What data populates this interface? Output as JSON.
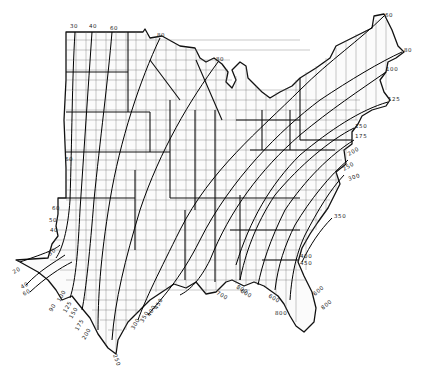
{
  "map": {
    "description": "Contour isoline map over the central and eastern United States with county boundaries",
    "background_color": "#ffffff",
    "line_color": "#000000",
    "contour_labels": [
      {
        "id": "n30",
        "text": "30",
        "x": 70,
        "y": 28,
        "rotate": 0
      },
      {
        "id": "n40",
        "text": "40",
        "x": 89,
        "y": 28,
        "rotate": 0
      },
      {
        "id": "n60",
        "text": "60",
        "x": 110,
        "y": 30,
        "rotate": 0
      },
      {
        "id": "n80a",
        "text": "80",
        "x": 157,
        "y": 37,
        "rotate": 0
      },
      {
        "id": "n80b",
        "text": "80",
        "x": 216,
        "y": 61,
        "rotate": 0
      },
      {
        "id": "ne60",
        "text": "60",
        "x": 385,
        "y": 17,
        "rotate": -15
      },
      {
        "id": "ne80",
        "text": "80",
        "x": 404,
        "y": 52,
        "rotate": 0
      },
      {
        "id": "e100",
        "text": "100",
        "x": 386,
        "y": 71,
        "rotate": 0
      },
      {
        "id": "e125",
        "text": "125",
        "x": 388,
        "y": 101,
        "rotate": 0
      },
      {
        "id": "e150",
        "text": "150",
        "x": 355,
        "y": 128,
        "rotate": 0
      },
      {
        "id": "e175",
        "text": "175",
        "x": 355,
        "y": 138,
        "rotate": 0
      },
      {
        "id": "e200",
        "text": "200",
        "x": 349,
        "y": 156,
        "rotate": -30
      },
      {
        "id": "e250",
        "text": "250",
        "x": 344,
        "y": 171,
        "rotate": -30
      },
      {
        "id": "e300",
        "text": "300",
        "x": 349,
        "y": 181,
        "rotate": -20
      },
      {
        "id": "e350",
        "text": "350",
        "x": 334,
        "y": 218,
        "rotate": 0
      },
      {
        "id": "se400",
        "text": "400",
        "x": 300,
        "y": 258,
        "rotate": 0
      },
      {
        "id": "se450",
        "text": "450",
        "x": 300,
        "y": 265,
        "rotate": 0
      },
      {
        "id": "fl600a",
        "text": "600",
        "x": 240,
        "y": 292,
        "rotate": 30
      },
      {
        "id": "fl600b",
        "text": "600",
        "x": 268,
        "y": 297,
        "rotate": 30
      },
      {
        "id": "fl600c",
        "text": "600",
        "x": 315,
        "y": 296,
        "rotate": -40
      },
      {
        "id": "fl800a",
        "text": "800",
        "x": 275,
        "y": 315,
        "rotate": 0
      },
      {
        "id": "fl800b",
        "text": "800",
        "x": 323,
        "y": 310,
        "rotate": -40
      },
      {
        "id": "g700",
        "text": "700",
        "x": 216,
        "y": 294,
        "rotate": 30
      },
      {
        "id": "g800",
        "text": "800",
        "x": 236,
        "y": 288,
        "rotate": 30
      },
      {
        "id": "w60a",
        "text": "60",
        "x": 65,
        "y": 161,
        "rotate": 0
      },
      {
        "id": "w60b",
        "text": "60",
        "x": 52,
        "y": 210,
        "rotate": 0
      },
      {
        "id": "w50",
        "text": "50",
        "x": 49,
        "y": 222,
        "rotate": 0
      },
      {
        "id": "w40",
        "text": "40",
        "x": 50,
        "y": 232,
        "rotate": 0
      },
      {
        "id": "w30",
        "text": "30",
        "x": 50,
        "y": 256,
        "rotate": -40
      },
      {
        "id": "w20",
        "text": "20",
        "x": 14,
        "y": 274,
        "rotate": -30
      },
      {
        "id": "w40b",
        "text": "40",
        "x": 22,
        "y": 289,
        "rotate": -30
      },
      {
        "id": "w60c",
        "text": "60",
        "x": 24,
        "y": 296,
        "rotate": -30
      },
      {
        "id": "t90",
        "text": "90",
        "x": 52,
        "y": 312,
        "rotate": -60
      },
      {
        "id": "t100",
        "text": "100",
        "x": 60,
        "y": 302,
        "rotate": -60
      },
      {
        "id": "t125",
        "text": "125",
        "x": 66,
        "y": 313,
        "rotate": -60
      },
      {
        "id": "t150",
        "text": "150",
        "x": 72,
        "y": 319,
        "rotate": -60
      },
      {
        "id": "t175",
        "text": "175",
        "x": 78,
        "y": 331,
        "rotate": -60
      },
      {
        "id": "t200",
        "text": "200",
        "x": 85,
        "y": 340,
        "rotate": -60
      },
      {
        "id": "t250",
        "text": "250",
        "x": 113,
        "y": 355,
        "rotate": 70
      },
      {
        "id": "g300",
        "text": "300",
        "x": 134,
        "y": 330,
        "rotate": -60
      },
      {
        "id": "g350",
        "text": "350",
        "x": 143,
        "y": 323,
        "rotate": -60
      },
      {
        "id": "g400",
        "text": "400",
        "x": 150,
        "y": 317,
        "rotate": -60
      },
      {
        "id": "g450",
        "text": "450",
        "x": 157,
        "y": 310,
        "rotate": -60
      }
    ]
  }
}
